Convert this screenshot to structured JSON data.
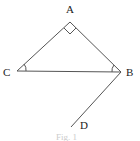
{
  "figure": {
    "caption": "Fig. 1",
    "points": {
      "A": {
        "label": "A",
        "x": 70,
        "y": 22
      },
      "B": {
        "label": "B",
        "x": 121,
        "y": 72
      },
      "C": {
        "label": "C",
        "x": 17,
        "y": 71
      },
      "D": {
        "label": "D",
        "x": 71,
        "y": 127
      }
    },
    "segments": [
      "AB",
      "AC",
      "CB",
      "BD"
    ],
    "right_angle_at": "A",
    "angle_marks": [
      "C",
      "B"
    ],
    "line_color": "#555555"
  }
}
